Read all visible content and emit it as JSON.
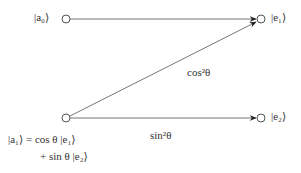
{
  "diagram": {
    "nodes": [
      {
        "id": "a0",
        "label": "|a₀⟩",
        "x": 66,
        "y": 19
      },
      {
        "id": "e1",
        "label": "|e₁⟩",
        "x": 262,
        "y": 19
      },
      {
        "id": "a1",
        "label": "|a₁⟩",
        "x": 66,
        "y": 118
      },
      {
        "id": "e2",
        "label": "|e₂⟩",
        "x": 262,
        "y": 118
      }
    ],
    "edges": [
      {
        "from": "a0",
        "to": "e1",
        "label": ""
      },
      {
        "from": "a1",
        "to": "e1",
        "label": "cos²θ"
      },
      {
        "from": "a1",
        "to": "e2",
        "label": "sin²θ"
      }
    ],
    "a1_equation_line1": "|a₁⟩ = cos θ  |e₁⟩",
    "a1_equation_line2": "+ sin θ  |e₂⟩",
    "colors": {
      "line": "#666666",
      "arrow": "#222222",
      "text": "#333333"
    }
  }
}
